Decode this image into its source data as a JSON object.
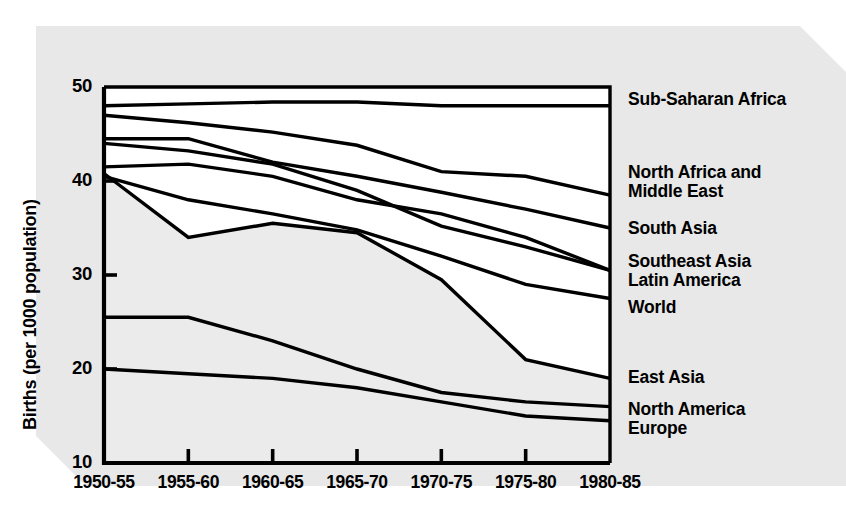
{
  "chart_data": {
    "type": "line",
    "title": "",
    "xlabel": "",
    "ylabel": "Births (per 1000 population)",
    "categories": [
      "1950-55",
      "1955-60",
      "1960-65",
      "1965-70",
      "1970-75",
      "1975-80",
      "1980-85"
    ],
    "ylim": [
      10,
      50
    ],
    "yticks": [
      10,
      20,
      30,
      40,
      50
    ],
    "grid": false,
    "legend_position": "right-of-plot-at-series-end",
    "background_color": "#e8e8e8",
    "line_color": "#000000",
    "band_fill_color": "#ebebeb",
    "band_note": "Light gray shaded region fills the area beneath the East Asia line, representing the World average band",
    "series": [
      {
        "name": "Sub-Saharan Africa",
        "values": [
          48.0,
          48.2,
          48.4,
          48.4,
          48.0,
          48.0,
          48.0
        ]
      },
      {
        "name": "North Africa and Middle East",
        "values": [
          47.0,
          46.2,
          45.2,
          43.8,
          41.0,
          40.5,
          38.5
        ]
      },
      {
        "name": "South Asia",
        "values": [
          44.5,
          44.5,
          42.0,
          40.5,
          38.8,
          37.0,
          35.0
        ]
      },
      {
        "name": "Southeast Asia",
        "values": [
          44.0,
          43.2,
          41.8,
          39.0,
          35.2,
          33.0,
          30.5
        ]
      },
      {
        "name": "Latin America",
        "values": [
          41.5,
          41.8,
          40.5,
          38.0,
          36.5,
          34.0,
          30.5
        ]
      },
      {
        "name": "World",
        "values": [
          40.5,
          38.0,
          36.5,
          34.8,
          32.0,
          29.0,
          27.5
        ]
      },
      {
        "name": "East Asia",
        "values": [
          40.8,
          34.0,
          35.5,
          34.5,
          29.5,
          21.0,
          19.0
        ]
      },
      {
        "name": "North America",
        "values": [
          25.5,
          25.5,
          23.0,
          20.0,
          17.5,
          16.5,
          16.0
        ]
      },
      {
        "name": "Europe",
        "values": [
          20.0,
          19.5,
          19.0,
          18.0,
          16.5,
          15.0,
          14.5
        ]
      }
    ],
    "legend_entries": [
      {
        "label": "Sub-Saharan Africa"
      },
      {
        "label": "North Africa and"
      },
      {
        "label": "Middle East"
      },
      {
        "label": "South Asia"
      },
      {
        "label": "Southeast Asia"
      },
      {
        "label": "Latin America"
      },
      {
        "label": "World"
      },
      {
        "label": "East Asia"
      },
      {
        "label": "North America"
      },
      {
        "label": "Europe"
      }
    ]
  }
}
